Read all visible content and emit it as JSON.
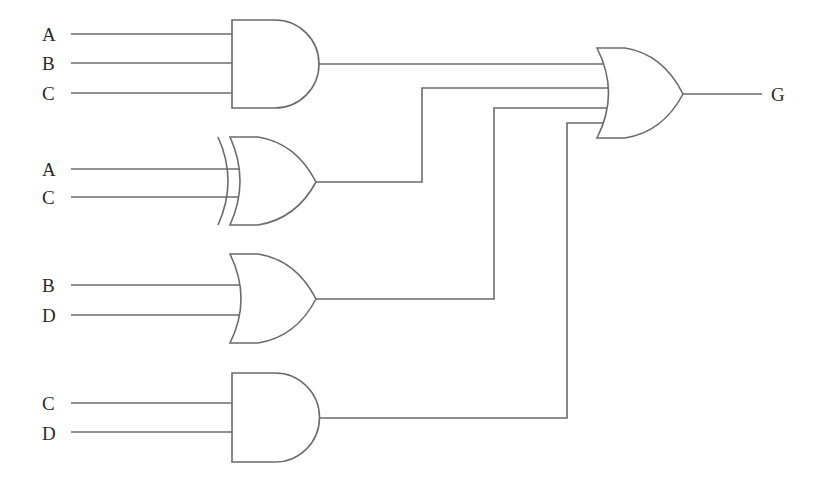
{
  "diagram": {
    "type": "logic-circuit",
    "output": {
      "label": "G"
    },
    "gates": [
      {
        "id": "and1",
        "type": "AND",
        "inputs": [
          "A",
          "B",
          "C"
        ]
      },
      {
        "id": "xor1",
        "type": "XOR",
        "inputs": [
          "A",
          "C"
        ]
      },
      {
        "id": "or1",
        "type": "OR",
        "inputs": [
          "B",
          "D"
        ]
      },
      {
        "id": "and2",
        "type": "AND",
        "inputs": [
          "C",
          "D"
        ]
      },
      {
        "id": "or_final",
        "type": "OR",
        "inputs": [
          "and1",
          "xor1",
          "or1",
          "and2"
        ],
        "output": "G"
      }
    ],
    "labels": {
      "and1_a": "A",
      "and1_b": "B",
      "and1_c": "C",
      "xor1_a": "A",
      "xor1_c": "C",
      "or1_b": "B",
      "or1_d": "D",
      "and2_c": "C",
      "and2_d": "D",
      "output": "G"
    }
  }
}
